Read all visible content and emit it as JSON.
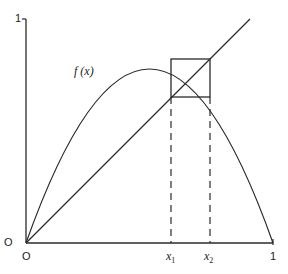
{
  "diagram": {
    "type": "cobweb / period-2 orbit of logistic map",
    "function_label": "f (x)",
    "y_axis": {
      "top_label": "1",
      "origin_label": "O"
    },
    "x_axis": {
      "origin_label": "O",
      "end_label": "1",
      "ticks": [
        {
          "label": "x",
          "sub": "1"
        },
        {
          "label": "x",
          "sub": "2"
        }
      ]
    },
    "elements": [
      "parabola f(x)",
      "diagonal y = x",
      "square cycle between x1 and x2",
      "dashed verticals from x1, x2"
    ]
  },
  "colors": {
    "line": "#2a2a2a",
    "background": "#ffffff"
  }
}
